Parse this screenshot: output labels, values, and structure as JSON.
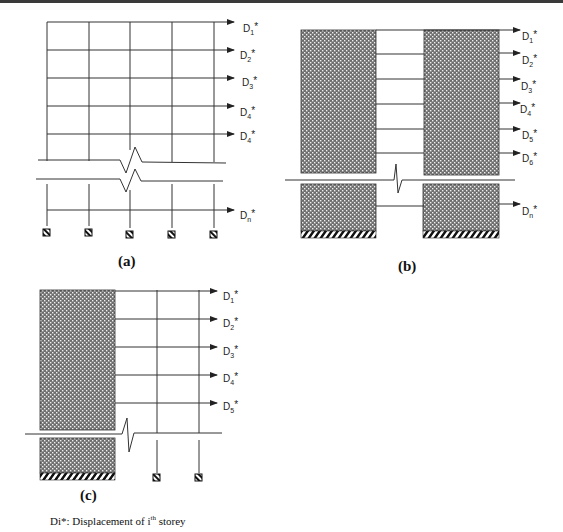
{
  "figure": {
    "panels": [
      {
        "id": "a",
        "label": "(a)",
        "type": "bare frame",
        "displacement_labels": [
          {
            "base": "D",
            "sub": "1",
            "sup": "*"
          },
          {
            "base": "D",
            "sub": "2",
            "sup": "*"
          },
          {
            "base": "D",
            "sub": "3",
            "sup": "*"
          },
          {
            "base": "D",
            "sub": "4",
            "sup": "*"
          },
          {
            "base": "D",
            "sub": "4",
            "sup": "*"
          },
          {
            "base": "D",
            "sub": "n",
            "sup": "*"
          }
        ]
      },
      {
        "id": "b",
        "label": "(b)",
        "type": "coupled shear walls",
        "displacement_labels": [
          {
            "base": "D",
            "sub": "1",
            "sup": "*"
          },
          {
            "base": "D",
            "sub": "2",
            "sup": "*"
          },
          {
            "base": "D",
            "sub": "3",
            "sup": "*"
          },
          {
            "base": "D",
            "sub": "4",
            "sup": "*"
          },
          {
            "base": "D",
            "sub": "5",
            "sup": "*"
          },
          {
            "base": "D",
            "sub": "6",
            "sup": "*"
          },
          {
            "base": "D",
            "sub": "n",
            "sup": "*"
          }
        ]
      },
      {
        "id": "c",
        "label": "(c)",
        "type": "wall-frame",
        "displacement_labels": [
          {
            "base": "D",
            "sub": "1",
            "sup": "*"
          },
          {
            "base": "D",
            "sub": "2",
            "sup": "*"
          },
          {
            "base": "D",
            "sub": "3",
            "sup": "*"
          },
          {
            "base": "D",
            "sub": "4",
            "sup": "*"
          },
          {
            "base": "D",
            "sub": "5",
            "sup": "*"
          }
        ]
      }
    ],
    "caption": {
      "prefix": "Di*: Displacement of i",
      "superscript": "th",
      "suffix": " storey"
    },
    "colors": {
      "line": "#333333",
      "wall_fill": "#8a8a8a",
      "wall_dots": "#ffffff",
      "hatch": "#111111"
    }
  }
}
